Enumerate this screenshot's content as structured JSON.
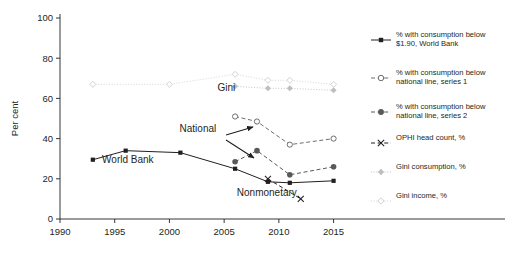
{
  "chart_data": {
    "type": "line",
    "title": "",
    "xlabel": "",
    "ylabel": "Per cent",
    "xlim": [
      1990,
      2016.5
    ],
    "ylim": [
      0,
      100
    ],
    "xticks": [
      1990,
      1995,
      2000,
      2005,
      2010,
      2015
    ],
    "yticks": [
      0,
      20,
      40,
      60,
      80,
      100
    ],
    "xtick_labels": [
      "1990",
      "1995",
      "2000",
      "2005",
      "2010",
      "2015"
    ],
    "ytick_labels": [
      "0",
      "20",
      "40",
      "60",
      "80",
      "100"
    ],
    "grid": false,
    "legend_position": "right",
    "series": [
      {
        "name": "% with consumption below $1.90, World Bank",
        "marker": "filled-square",
        "line": "solid",
        "color": "#231f20",
        "x": [
          1993,
          1996,
          2001,
          2006,
          2009,
          2011,
          2015
        ],
        "values": [
          29.5,
          34,
          33,
          25,
          18.5,
          18,
          19
        ]
      },
      {
        "name": "% with consumption below national line, series 1",
        "marker": "open-circle",
        "line": "dashed",
        "color": "#6d6e71",
        "x": [
          2006,
          2008,
          2011,
          2015
        ],
        "values": [
          51,
          48.5,
          37,
          40
        ]
      },
      {
        "name": "% with consumption below national line, series 2",
        "marker": "filled-circle",
        "line": "dashed",
        "color": "#58595b",
        "x": [
          2006,
          2008,
          2011,
          2015
        ],
        "values": [
          28.5,
          34,
          22,
          26
        ]
      },
      {
        "name": "OPHI head count, %",
        "marker": "cross-x",
        "line": "dashed",
        "color": "#231f20",
        "x": [
          2009,
          2012
        ],
        "values": [
          20,
          10
        ]
      },
      {
        "name": "Gini consumption, %",
        "marker": "filled-diamond",
        "line": "dotted",
        "color": "#bcbec0",
        "x": [
          2006,
          2009,
          2011,
          2015
        ],
        "values": [
          66,
          65,
          65,
          64
        ]
      },
      {
        "name": "Gini income, %",
        "marker": "open-diamond",
        "line": "dotted",
        "color": "#d1d3d4",
        "x": [
          1993,
          2000,
          2006,
          2009,
          2011,
          2015
        ],
        "values": [
          67,
          67,
          72,
          69,
          69,
          67
        ]
      }
    ],
    "annotations": [
      {
        "text": "Gini",
        "x": 2005.2,
        "y": 63.5
      },
      {
        "text": "World Bank",
        "x": 1996.2,
        "y": 28.0
      },
      {
        "text": "National",
        "x": 2002.6,
        "y": 43.5
      },
      {
        "text": "Nonmonetary",
        "x": 2008.9,
        "y": 11.5
      }
    ]
  },
  "axis": {
    "y_title": "Per cent"
  },
  "legend": {
    "items": [
      {
        "label": "% with consumption below\n$1.90, World Bank",
        "marker": "filled-square",
        "line": "solid",
        "color": "#231f20"
      },
      {
        "label": "% with consumption below\nnational line, series 1",
        "marker": "open-circle",
        "line": "dashed",
        "color": "#6d6e71"
      },
      {
        "label": "% with consumption below\nnational line, series 2",
        "marker": "filled-circle",
        "line": "dashed",
        "color": "#58595b"
      },
      {
        "label": "OPHI head count, %",
        "marker": "cross-x",
        "line": "dashed",
        "color": "#231f20"
      },
      {
        "label": "Gini consumption, %",
        "marker": "filled-diamond",
        "line": "dotted",
        "color": "#bcbec0"
      },
      {
        "label": "Gini income, %",
        "marker": "open-diamond",
        "line": "dotted",
        "color": "#d1d3d4"
      }
    ]
  },
  "colors": {
    "axis": "#231f20",
    "background": "#ffffff",
    "dark": "#231f20",
    "mid_gray": "#6d6e71",
    "light_gray": "#bcbec0",
    "lighter_gray": "#d1d3d4"
  }
}
